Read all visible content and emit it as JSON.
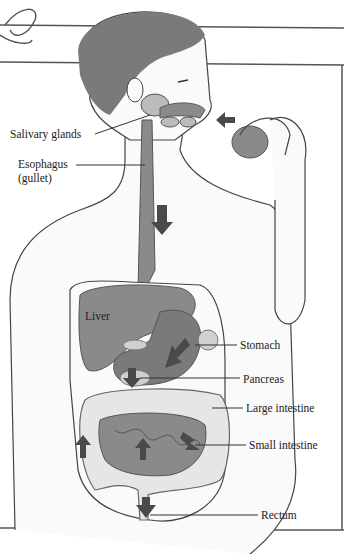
{
  "diagram": {
    "type": "anatomical illustration",
    "labels": {
      "salivary_glands": "Salivary glands",
      "esophagus": "Esophagus",
      "esophagus_alt": "(gullet)",
      "liver": "Liver",
      "stomach": "Stomach",
      "pancreas": "Pancreas",
      "large_intestine": "Large intestine",
      "small_intestine": "Small intestine",
      "rectum": "Rectum"
    },
    "colors": {
      "organ": "#8a8a8a",
      "organ_dark": "#6e6e6e",
      "arrow": "#4a4a4a",
      "hair": "#7a7a7a",
      "line": "#333333",
      "intestine": "#e6e6e6"
    }
  }
}
